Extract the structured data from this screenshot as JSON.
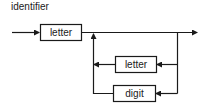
{
  "diagram": {
    "type": "syntax-railroad",
    "title": "identifier",
    "colors": {
      "stroke": "#1a1a1a",
      "background": "#ffffff"
    },
    "nodes": [
      {
        "id": "letter-1",
        "label": "letter",
        "role": "first-character"
      },
      {
        "id": "letter-2",
        "label": "letter",
        "role": "repeat-option"
      },
      {
        "id": "digit",
        "label": "digit",
        "role": "repeat-option"
      }
    ],
    "edges": [
      {
        "from": "start",
        "to": "letter-1"
      },
      {
        "from": "letter-1",
        "to": "end"
      },
      {
        "from": "loop-right",
        "to": "letter-2"
      },
      {
        "from": "loop-right",
        "to": "digit"
      },
      {
        "from": "letter-2",
        "to": "loop-left"
      },
      {
        "from": "digit",
        "to": "loop-left"
      },
      {
        "from": "loop-left",
        "to": "main-line"
      }
    ]
  }
}
